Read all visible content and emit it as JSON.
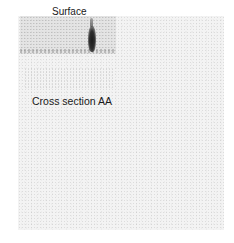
{
  "figure": {
    "labels": {
      "surface": "Surface",
      "cross_section": "Cross section AA"
    },
    "colors": {
      "background": "#ffffff",
      "field": "#f3f3f3",
      "mark": "#1b1b1b",
      "text": "#1a1a1a"
    }
  }
}
